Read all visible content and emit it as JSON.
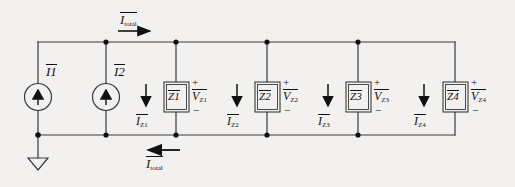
{
  "figure": {
    "type": "circuit-diagram",
    "background_color": "#f2f1ef",
    "line_color": "#3a3a3a",
    "text_color": "#111111"
  },
  "rails": {
    "top": {
      "label_base": "I",
      "label_sub": "total",
      "overbar": true,
      "arrow_direction": "right"
    },
    "bottom": {
      "label_base": "I",
      "label_sub": "total",
      "overbar": true,
      "arrow_direction": "left"
    }
  },
  "sources": [
    {
      "id": "I1",
      "label_base": "I",
      "label_sub": "1",
      "overbar": true,
      "symbol": "current-source",
      "arrow_direction": "up"
    },
    {
      "id": "I2",
      "label_base": "I",
      "label_sub": "2",
      "overbar": true,
      "symbol": "current-source",
      "arrow_direction": "up"
    }
  ],
  "ground": {
    "symbol": "ground-triangle",
    "attached_node": "left-bottom-node"
  },
  "branches": [
    {
      "id": "Z1",
      "impedance_base": "Z",
      "impedance_sub": "1",
      "impedance_overbar": true,
      "current_base": "I",
      "current_sub": "Z1",
      "current_overbar": true,
      "current_arrow_direction": "down",
      "voltage_base": "V",
      "voltage_sub": "Z1",
      "voltage_overbar": true,
      "polarity_top": "+",
      "polarity_bottom": "−"
    },
    {
      "id": "Z2",
      "impedance_base": "Z",
      "impedance_sub": "2",
      "impedance_overbar": true,
      "current_base": "I",
      "current_sub": "Z2",
      "current_overbar": true,
      "current_arrow_direction": "down",
      "voltage_base": "V",
      "voltage_sub": "Z2",
      "voltage_overbar": true,
      "polarity_top": "+",
      "polarity_bottom": "−"
    },
    {
      "id": "Z3",
      "impedance_base": "Z",
      "impedance_sub": "3",
      "impedance_overbar": true,
      "current_base": "I",
      "current_sub": "Z3",
      "current_overbar": true,
      "current_arrow_direction": "down",
      "voltage_base": "V",
      "voltage_sub": "Z3",
      "voltage_overbar": true,
      "polarity_top": "+",
      "polarity_bottom": "−"
    },
    {
      "id": "Z4",
      "impedance_base": "Z",
      "impedance_sub": "4",
      "impedance_overbar": true,
      "current_base": "I",
      "current_sub": "Z4",
      "current_overbar": true,
      "current_arrow_direction": "down",
      "voltage_base": "V",
      "voltage_sub": "Z4",
      "voltage_overbar": true,
      "polarity_top": "+",
      "polarity_bottom": "−"
    }
  ]
}
